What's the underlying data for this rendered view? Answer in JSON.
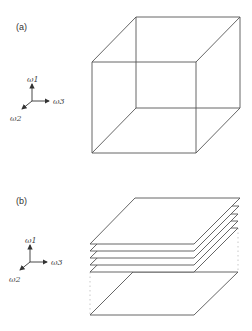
{
  "panels": [
    {
      "label": "(a)",
      "axes": {
        "up": "ω1",
        "right": "ω3",
        "diag": "ω2"
      },
      "shape": "cube"
    },
    {
      "label": "(b)",
      "axes": {
        "up": "ω1",
        "right": "ω3",
        "diag": "ω2"
      },
      "shape": "stacked-planes",
      "stacked_plane_count": 5
    }
  ],
  "colors": {
    "line": "#555555",
    "dotted": "#bbbbbb",
    "text": "#333333"
  }
}
